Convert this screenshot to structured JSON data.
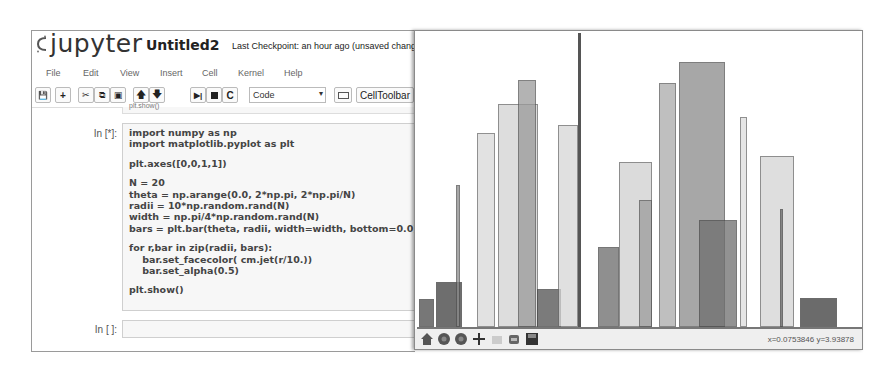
{
  "notebook": {
    "logo_text": "jupyter",
    "title": "Untitled2",
    "checkpoint": "Last Checkpoint: an hour ago (unsaved changes)",
    "menu": [
      "File",
      "Edit",
      "View",
      "Insert",
      "Cell",
      "Kernel",
      "Help"
    ],
    "toolbar": {
      "buttons": [
        "save-icon",
        "plus-icon",
        "cut-icon",
        "copy-icon",
        "paste-icon",
        "arrow-up-icon",
        "arrow-down-icon",
        "run-icon",
        "stop-icon",
        "restart-icon"
      ],
      "cell_type": "Code",
      "keyboard_label": "keyboard-icon",
      "celltoolbar_label": "CellToolbar"
    },
    "prev_cell_text": "plt.show()",
    "cells": [
      {
        "prompt": "In [*]:",
        "lines": [
          "import numpy as np",
          "import matplotlib.pyplot as plt",
          "",
          "plt.axes([0,0,1,1])",
          "",
          "N = 20",
          "theta = np.arange(0.0, 2*np.pi, 2*np.pi/N)",
          "radii = 10*np.random.rand(N)",
          "width = np.pi/4*np.random.rand(N)",
          "bars = plt.bar(theta, radii, width=width, bottom=0.0)",
          "",
          "for r,bar in zip(radii, bars):",
          "    bar.set_facecolor( cm.jet(r/10.))",
          "    bar.set_alpha(0.5)",
          "",
          "plt.show()"
        ]
      },
      {
        "prompt": "In [ ]:",
        "lines": []
      }
    ]
  },
  "plot_window": {
    "toolbar": [
      "home-icon",
      "back-icon",
      "forward-icon",
      "pan-icon",
      "zoom-icon",
      "configure-icon",
      "save-icon"
    ],
    "coords": "x=0.0753846    y=3.93878"
  },
  "chart_data": {
    "type": "bar",
    "title": "",
    "xlabel": "",
    "ylabel": "",
    "grid": false,
    "note": "Overlapping semi-transparent bars (alpha 0.5) rendered in grayscale; positions in pixels within plot canvas (445x294), heights relative to canvas.",
    "bars": [
      {
        "x": 2,
        "w": 15,
        "top": 266,
        "shade": "#4a4a4a"
      },
      {
        "x": 19,
        "w": 26,
        "top": 249,
        "shade": "#3e3e3e"
      },
      {
        "x": 39,
        "w": 4,
        "top": 152,
        "shade": "#8a8a8a"
      },
      {
        "x": 60,
        "w": 18,
        "top": 100,
        "shade": "#d9d9d9"
      },
      {
        "x": 81,
        "w": 40,
        "top": 71,
        "shade": "#d2d2d2"
      },
      {
        "x": 101,
        "w": 18,
        "top": 47,
        "shade": "#9a9a9a"
      },
      {
        "x": 120,
        "w": 24,
        "top": 256,
        "shade": "#4f4f4f"
      },
      {
        "x": 141,
        "w": 20,
        "top": 92,
        "shade": "#d6d6d6"
      },
      {
        "x": 181,
        "w": 21,
        "top": 214,
        "shade": "#6a6a6a"
      },
      {
        "x": 202,
        "w": 33,
        "top": 129,
        "shade": "#d0d0d0"
      },
      {
        "x": 222,
        "w": 13,
        "top": 167,
        "shade": "#9c9c9c"
      },
      {
        "x": 242,
        "w": 17,
        "top": 50,
        "shade": "#aaaaaa"
      },
      {
        "x": 262,
        "w": 46,
        "top": 29,
        "shade": "#8a8a8a"
      },
      {
        "x": 282,
        "w": 38,
        "top": 187,
        "shade": "#6e6e6e"
      },
      {
        "x": 323,
        "w": 7,
        "top": 84,
        "shade": "#dddddd"
      },
      {
        "x": 343,
        "w": 34,
        "top": 123,
        "shade": "#d4d4d4"
      },
      {
        "x": 363,
        "w": 3,
        "top": 176,
        "shade": "#666666"
      },
      {
        "x": 383,
        "w": 37,
        "top": 265,
        "shade": "#3a3a3a"
      }
    ],
    "vertical_line": {
      "x": 161,
      "w": 3
    }
  }
}
